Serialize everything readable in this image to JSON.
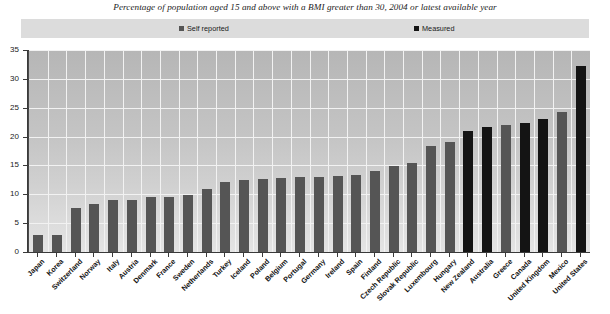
{
  "chart_data": {
    "type": "bar",
    "title": "Percentage of population aged 15 and above with a BMI greater than 30, 2004 or latest available year",
    "xlabel": "",
    "ylabel": "",
    "ylim": [
      0,
      35
    ],
    "yticks": [
      0,
      5,
      10,
      15,
      20,
      25,
      30,
      35
    ],
    "ytick_labels": [
      "0",
      "5",
      "10",
      "15",
      "20",
      "25",
      "30",
      "35"
    ],
    "grid": true,
    "legend_position": "top",
    "legend": [
      {
        "name": "Self reported",
        "color": "#555555"
      },
      {
        "name": "Measured",
        "color": "#141414"
      }
    ],
    "categories": [
      "Japan",
      "Korea",
      "Switzerland",
      "Norway",
      "Italy",
      "Austria",
      "Denmark",
      "France",
      "Sweden",
      "Netherlands",
      "Turkey",
      "Iceland",
      "Poland",
      "Belgium",
      "Portugal",
      "Germany",
      "Ireland",
      "Spain",
      "Finland",
      "Czech Republic",
      "Slovak Republic",
      "Luxembourg",
      "Hungary",
      "New Zealand",
      "Australia",
      "Greece",
      "Canada",
      "United Kingdom",
      "Mexico",
      "United States"
    ],
    "values": [
      2.9,
      3.0,
      7.7,
      8.3,
      9.0,
      9.1,
      9.5,
      9.5,
      9.8,
      10.9,
      12.2,
      12.5,
      12.6,
      12.8,
      13.0,
      13.0,
      13.2,
      13.3,
      14.1,
      14.9,
      15.5,
      18.4,
      19.0,
      21.0,
      21.7,
      22.0,
      22.4,
      23.0,
      24.2,
      32.2
    ],
    "series_of_point": [
      "Self reported",
      "Self reported",
      "Self reported",
      "Self reported",
      "Self reported",
      "Self reported",
      "Self reported",
      "Self reported",
      "Self reported",
      "Self reported",
      "Self reported",
      "Self reported",
      "Self reported",
      "Self reported",
      "Self reported",
      "Self reported",
      "Self reported",
      "Self reported",
      "Self reported",
      "Self reported",
      "Self reported",
      "Self reported",
      "Self reported",
      "Measured",
      "Measured",
      "Self reported",
      "Measured",
      "Measured",
      "Self reported",
      "Measured"
    ]
  },
  "colors": {
    "self_reported": "#555555",
    "measured": "#141414",
    "legend_background": "#dcdcdc",
    "grid": "#f2f2f2",
    "axis": "#3a3a3a"
  }
}
